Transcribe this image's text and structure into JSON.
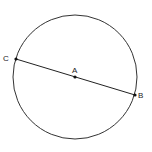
{
  "diagram": {
    "circle": {
      "cx": 75,
      "cy": 77,
      "r": 62,
      "stroke": "#333333"
    },
    "points": [
      {
        "id": "C",
        "label": "C",
        "x": 16,
        "y": 59,
        "lx": 3,
        "ly": 61
      },
      {
        "id": "A",
        "label": "A",
        "x": 75,
        "y": 77,
        "lx": 72,
        "ly": 73
      },
      {
        "id": "B",
        "label": "B",
        "x": 135,
        "y": 95,
        "lx": 138,
        "ly": 98
      }
    ],
    "segment": {
      "from": "C",
      "to": "B",
      "label": "diameter CB"
    }
  }
}
